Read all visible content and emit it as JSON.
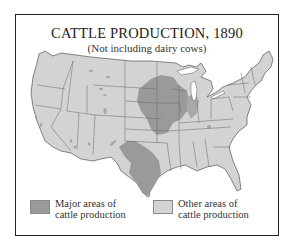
{
  "map": {
    "title": "CATTLE PRODUCTION, 1890",
    "subtitle": "(Not including dairy cows)",
    "colors": {
      "major": "#9a9a9a",
      "other": "#d3d3d3",
      "border": "#555555",
      "water": "#ffffff"
    }
  },
  "legend": {
    "items": [
      {
        "label_line1": "Major areas of",
        "label_line2": "cattle production",
        "color": "#9a9a9a"
      },
      {
        "label_line1": "Other areas of",
        "label_line2": "cattle production",
        "color": "#d3d3d3"
      }
    ]
  }
}
